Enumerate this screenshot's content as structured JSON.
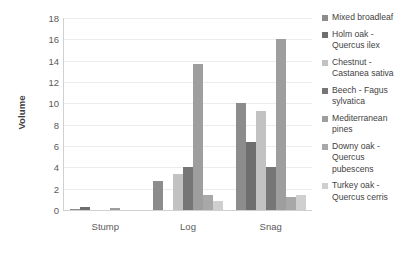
{
  "chart_data": {
    "type": "bar",
    "title": "",
    "subtitle": "",
    "xlabel": "",
    "ylabel": "Volume",
    "categories": [
      "Stump",
      "Log",
      "Snag"
    ],
    "ylim": [
      0,
      18
    ],
    "ytick_step": 2,
    "ytick_labels": [
      "0",
      "2",
      "4",
      "6",
      "8",
      "10",
      "12",
      "14",
      "16",
      "18"
    ],
    "grid": true,
    "legend_position": "right",
    "orientation": "vertical",
    "series": [
      {
        "name": "Mixed broadleaf",
        "legend_label": "Mixed broadleaf",
        "color": "#8c8c8c",
        "values": [
          0.1,
          2.7,
          10.0
        ]
      },
      {
        "name": "Holm oak - Quercus ilex",
        "legend_label": "Holm oak -\nQuercus ilex",
        "color": "#6e6e6e",
        "values": [
          0.3,
          0.0,
          6.4
        ]
      },
      {
        "name": "Chestnut - Castanea sativa",
        "legend_label": "Chestnut -\nCastanea sativa",
        "color": "#c2c2c2",
        "values": [
          0.0,
          3.4,
          9.3
        ]
      },
      {
        "name": "Beech - Fagus sylvatica",
        "legend_label": "Beech - Fagus\nsylvatica",
        "color": "#767676",
        "values": [
          0.0,
          4.0,
          4.0
        ]
      },
      {
        "name": "Mediterranean pines",
        "legend_label": "Mediterranean\npines",
        "color": "#9e9e9e",
        "values": [
          0.15,
          13.7,
          16.0
        ]
      },
      {
        "name": "Downy oak - Quercus pubescens",
        "legend_label": "Downy oak -\nQuercus\npubescens",
        "color": "#a8a8a8",
        "values": [
          0.0,
          1.4,
          1.2
        ]
      },
      {
        "name": "Turkey oak - Quercus cerris",
        "legend_label": "Turkey oak -\nQuercus cerris",
        "color": "#cfcfcf",
        "values": [
          0.0,
          0.8,
          1.4
        ]
      }
    ]
  },
  "axis": {
    "y_title": "Volume"
  },
  "style": {
    "gridline_color": "#ececec",
    "axis_color": "#d0d0d0",
    "text_color": "#4a4a4a",
    "background": "#ffffff"
  }
}
